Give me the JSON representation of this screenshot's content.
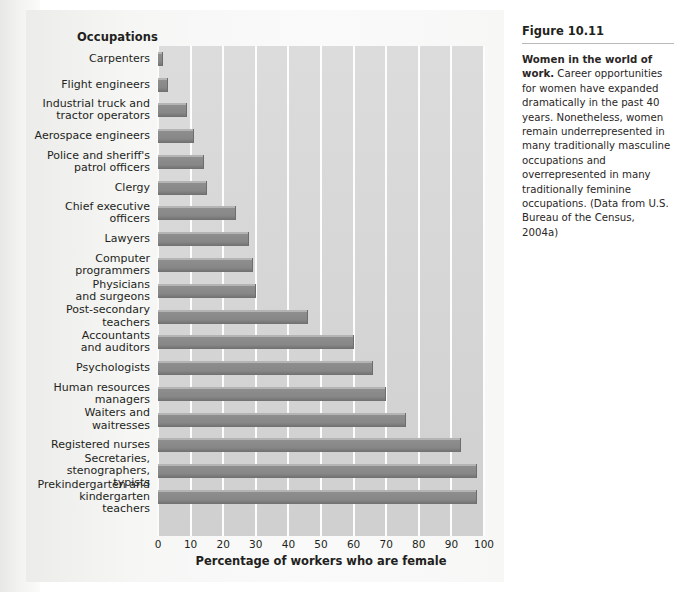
{
  "figure": {
    "number_label": "Figure 10.11",
    "caption_bold": "Women in the world of work.",
    "caption_text": " Career opportunities for women have expanded dramatically in the past 40 years. Nonetheless, women remain underrepresented in many traditionally masculine occupations and overrepresented in many traditionally feminine occupations. (Data from U.S. Bureau of the Census, 2004a)"
  },
  "chart_header": {
    "category_axis_title": "Occupations"
  },
  "chart_data": {
    "type": "bar",
    "orientation": "horizontal",
    "title": "Women in the world of work.",
    "xlabel": "Percentage of workers who are female",
    "ylabel": "Occupations",
    "xlim": [
      0,
      100
    ],
    "xticks": [
      0,
      10,
      20,
      30,
      40,
      50,
      60,
      70,
      80,
      90,
      100
    ],
    "xtick_labels": [
      "0",
      "10",
      "20",
      "30",
      "40",
      "50",
      "60",
      "70",
      "80",
      "90",
      "100"
    ],
    "grid": "vertical-white-gridlines",
    "legend": "none",
    "bar_color": "#8a8a8a",
    "plot_background": "#d8d8d8",
    "source_note": "Data from U.S. Bureau of the Census, 2004a",
    "categories": [
      "Carpenters",
      "Flight engineers",
      "Industrial truck and\ntractor operators",
      "Aerospace engineers",
      "Police and sheriff's\npatrol officers",
      "Clergy",
      "Chief executive\nofficers",
      "Lawyers",
      "Computer\nprogrammers",
      "Physicians\nand surgeons",
      "Post-secondary\nteachers",
      "Accountants\nand auditors",
      "Psychologists",
      "Human resources\nmanagers",
      "Waiters and waitresses",
      "Registered nurses",
      "Secretaries,\nstenographers, typists",
      "Prekindergarten and\nkindergarten teachers"
    ],
    "values": [
      1.5,
      3,
      9,
      11,
      14,
      15,
      24,
      28,
      29,
      30,
      46,
      60,
      66,
      70,
      76,
      93,
      98,
      98
    ]
  }
}
